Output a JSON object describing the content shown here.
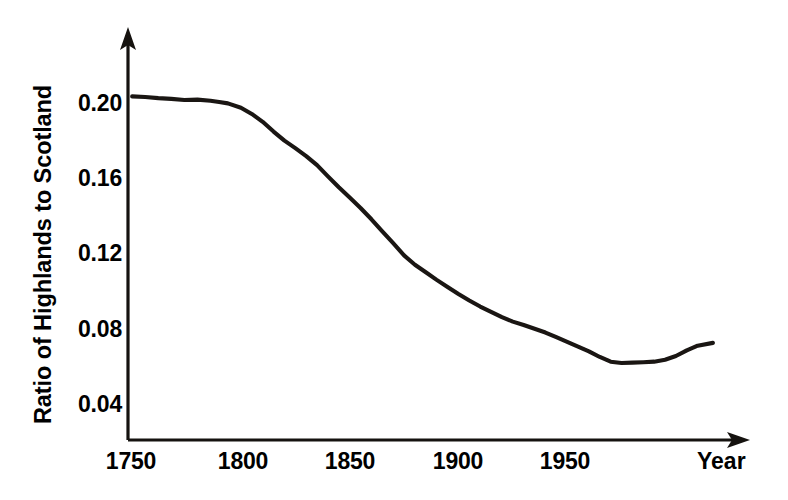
{
  "chart_data": {
    "type": "line",
    "title": "",
    "xlabel": "Year",
    "ylabel": "Ratio of Highlands to Scotland",
    "xlim": [
      1750,
      2018
    ],
    "ylim": [
      0.02,
      0.215
    ],
    "grid": false,
    "legend": null,
    "xticks": [
      1750,
      1800,
      1850,
      1900,
      1950
    ],
    "xtick_labels": [
      "1750",
      "1800",
      "1850",
      "1900",
      "1950"
    ],
    "yticks": [
      0.04,
      0.08,
      0.12,
      0.16,
      0.2
    ],
    "ytick_labels": [
      "0.04",
      "0.08",
      "0.12",
      "0.16",
      "0.20"
    ],
    "series": [
      {
        "name": "Ratio of Highlands to Scotland",
        "color": "#1a1613",
        "x": [
          1751,
          1757,
          1763,
          1769,
          1775,
          1781,
          1787,
          1791,
          1795,
          1801,
          1806,
          1811,
          1816,
          1821,
          1826,
          1831,
          1836,
          1841,
          1846,
          1851,
          1856,
          1861,
          1866,
          1871,
          1876,
          1881,
          1886,
          1891,
          1896,
          1901,
          1906,
          1911,
          1916,
          1921,
          1926,
          1931,
          1936,
          1941,
          1946,
          1951,
          1956,
          1961,
          1966,
          1971,
          1976,
          1981,
          1986,
          1991,
          1996,
          2001,
          2006,
          2011,
          2018
        ],
        "y": [
          0.2035,
          0.2032,
          0.2026,
          0.2022,
          0.2016,
          0.2018,
          0.2012,
          0.2005,
          0.1998,
          0.1975,
          0.1942,
          0.19,
          0.1848,
          0.18,
          0.176,
          0.1718,
          0.167,
          0.161,
          0.1552,
          0.1498,
          0.1442,
          0.1382,
          0.1318,
          0.1255,
          0.119,
          0.114,
          0.11,
          0.106,
          0.1022,
          0.0985,
          0.095,
          0.0918,
          0.089,
          0.0862,
          0.0838,
          0.082,
          0.08,
          0.078,
          0.0755,
          0.073,
          0.0705,
          0.068,
          0.065,
          0.0625,
          0.0618,
          0.062,
          0.0622,
          0.0625,
          0.0635,
          0.0655,
          0.0685,
          0.071,
          0.0725
        ]
      }
    ]
  },
  "axes": {
    "y_title": "Ratio of Highlands to Scotland",
    "x_title": "Year"
  }
}
